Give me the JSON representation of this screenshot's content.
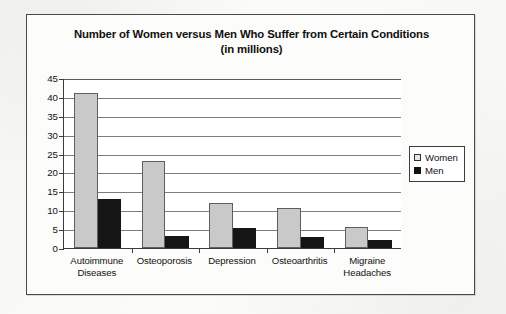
{
  "chart_data": {
    "type": "bar",
    "title": "Number of Women versus Men Who Suffer from Certain Conditions (in millions)",
    "title_line1": "Number of Women versus Men Who Suffer from Certain Conditions",
    "title_line2": "(in millions)",
    "xlabel": "",
    "ylabel": "",
    "ylim": [
      0,
      45
    ],
    "ytick_step": 5,
    "yticks": [
      0,
      5,
      10,
      15,
      20,
      25,
      30,
      35,
      40,
      45
    ],
    "ytick_labels": [
      "0",
      "5",
      "10",
      "15",
      "20",
      "25",
      "30",
      "35",
      "40",
      "45"
    ],
    "grid": true,
    "grid_axis": "y",
    "legend_position": "right-outside",
    "categories": [
      "Autoimmune Diseases",
      "Osteoporosis",
      "Depression",
      "Osteoarthritis",
      "Migraine Headaches"
    ],
    "category_lines": [
      [
        "Autoimmune",
        "Diseases"
      ],
      [
        "Osteoporosis",
        ""
      ],
      [
        "Depression",
        ""
      ],
      [
        "Osteoarthritis",
        ""
      ],
      [
        "Migraine",
        "Headaches"
      ]
    ],
    "series": [
      {
        "name": "Women",
        "color": "#c9c9c9",
        "values": [
          41,
          23,
          12,
          10.7,
          5.5
        ]
      },
      {
        "name": "Men",
        "color": "#151515",
        "values": [
          13,
          3.2,
          5.2,
          3,
          2
        ]
      }
    ]
  },
  "legend": {
    "entries": [
      {
        "label": "Women",
        "swatch": "women"
      },
      {
        "label": "Men",
        "swatch": "men"
      }
    ]
  }
}
